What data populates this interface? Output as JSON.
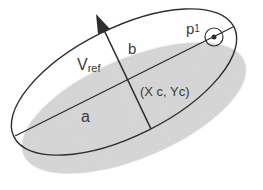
{
  "diagram": {
    "labels": {
      "p1": "p",
      "p1_sub": "1",
      "b": "b",
      "vref": "V",
      "vref_sub": "ref",
      "center": "(X c, Yc)",
      "a": "a"
    },
    "colors": {
      "outline": "#2e2e2e",
      "shaded_fill": "#d2d2d2",
      "background": "#ffffff",
      "text": "#3a3a3a"
    },
    "outline_ellipse": {
      "cx": 124,
      "cy": 82,
      "rx": 123,
      "ry": 54,
      "rotation_deg": -26.5
    },
    "shaded_ellipse": {
      "cx": 134,
      "cy": 108,
      "rx": 120,
      "ry": 50,
      "rotation_deg": -23
    },
    "major_axis": {
      "x1": 15,
      "y1": 136,
      "x2": 233,
      "y2": 27
    },
    "minor_axis": {
      "x1": 151,
      "y1": 129,
      "x2": 104,
      "y2": 30
    },
    "vref_arrow_tip": {
      "x": 96,
      "y": 14
    },
    "point_p1": {
      "x": 214,
      "y": 37,
      "marker_radius": 2.5,
      "ring_radius": 9
    }
  }
}
